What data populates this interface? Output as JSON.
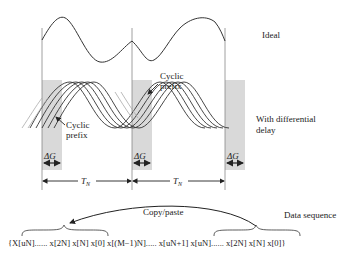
{
  "labels": {
    "ideal": "Ideal",
    "with_delay_line1": "With differential",
    "with_delay_line2": "delay",
    "cyclic_prefix_upper_line1": "Cyclic",
    "cyclic_prefix_upper_line2": "prefix",
    "cyclic_prefix_lower_line1": "Cyclic",
    "cyclic_prefix_lower_line2": "prefix",
    "delta_g": "ΔG",
    "t_n": "T",
    "t_n_sub": "N",
    "copy_paste": "Copy/paste",
    "data_sequence": "Data sequence"
  },
  "sequence": {
    "text": "{X[uN]...... x[2N] x[N] x[0] x[(M−1)N]..... x[uN+1]  x[uN]...... x[2N] x[N] x[0]}"
  },
  "colors": {
    "line": "#333333",
    "guard_shade": "#d9d9d9",
    "text": "#222222"
  }
}
